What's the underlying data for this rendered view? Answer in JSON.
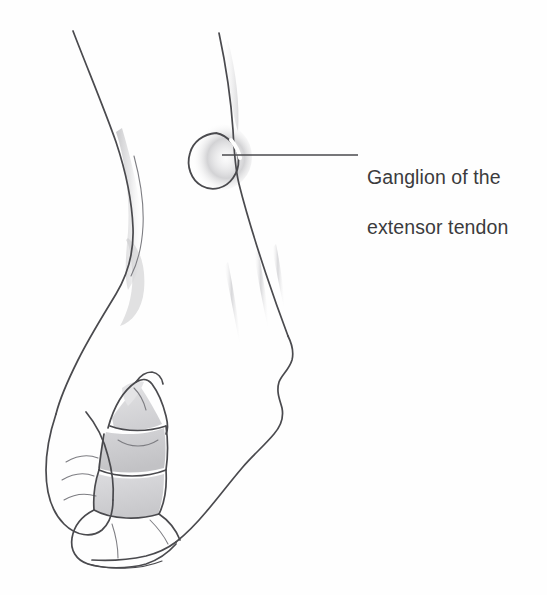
{
  "figure": {
    "kind": "medical-illustration",
    "background_color": "#fefefe",
    "ink_color": "#4a4a4e",
    "shading_color": "#c9c9cb",
    "text_color": "#3b3b3d"
  },
  "annotation": {
    "label_line_1": "Ganglion of the",
    "label_line_2": "extensor tendon",
    "full_label": "Ganglion of the extensor tendon",
    "leader_line": {
      "from_x": 222,
      "from_y": 155,
      "to_x": 358,
      "to_y": 155,
      "color": "#4a4a4e"
    }
  },
  "structures": {
    "ganglion": {
      "name": "ganglion",
      "center_x": 218,
      "center_y": 155,
      "radius": 23,
      "shape": "crescent-arc-open-upper-left",
      "halo_color": "#cfcfd1"
    },
    "wrist_contour_left": {
      "name": "radial-wrist-border"
    },
    "wrist_contour_right": {
      "name": "ulnar-wrist-border"
    },
    "thumb": {
      "name": "thumb"
    },
    "fingers": {
      "name": "flexed-fingers",
      "count": 3
    },
    "extensor_tendons": {
      "name": "extensor-tendon-shading",
      "count": 3
    }
  }
}
